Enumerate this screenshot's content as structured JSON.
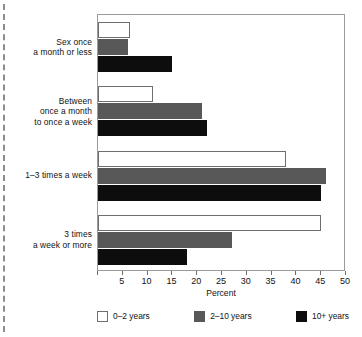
{
  "chart_data": {
    "type": "bar",
    "orientation": "horizontal",
    "title": "",
    "xlabel": "Percent",
    "ylabel": "",
    "xlim": [
      0,
      50
    ],
    "xticks": [
      0,
      5,
      10,
      15,
      20,
      25,
      30,
      35,
      40,
      45,
      50
    ],
    "xtick_labels": [
      "",
      "5",
      "10",
      "15",
      "20",
      "25",
      "30",
      "35",
      "40",
      "45",
      "50"
    ],
    "grid": false,
    "legend_position": "bottom",
    "categories": [
      "Sex once\na month or less",
      "Between\nonce a month\nto once a week",
      "1–3 times a week",
      "3 times\na week or more"
    ],
    "series": [
      {
        "name": "0–2 years",
        "color": "#ffffff",
        "values": [
          6.5,
          11,
          38,
          45
        ]
      },
      {
        "name": "2–10 years",
        "color": "#585858",
        "values": [
          6,
          21,
          46,
          27
        ]
      },
      {
        "name": "10+ years",
        "color": "#0d0d0d",
        "values": [
          15,
          22,
          45,
          18
        ]
      }
    ]
  },
  "axis": {
    "x_title": "Percent"
  },
  "legend": {
    "items": [
      {
        "label": "0–2 years",
        "swatch": "white-outline-swatch"
      },
      {
        "label": "2–10 years",
        "swatch": "gray-swatch"
      },
      {
        "label": "10+ years",
        "swatch": "black-swatch"
      }
    ]
  },
  "colors": {
    "series_0": "#ffffff",
    "series_1": "#585858",
    "series_2": "#0d0d0d",
    "frame": "#9a9a9a",
    "text": "#111111",
    "left_rule": "#8c8c8c"
  }
}
